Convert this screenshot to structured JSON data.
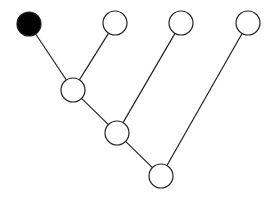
{
  "diagram": {
    "type": "binary-tree",
    "width": 267,
    "height": 198,
    "node_radius": 12,
    "colors": {
      "stroke": "#222222",
      "filled": "#000000",
      "empty": "#ffffff",
      "background": "#ffffff"
    },
    "nodes": [
      {
        "id": "leaf1",
        "x": 29,
        "y": 24,
        "filled": true
      },
      {
        "id": "leaf2",
        "x": 115,
        "y": 23,
        "filled": false
      },
      {
        "id": "leaf3",
        "x": 181,
        "y": 23,
        "filled": false
      },
      {
        "id": "leaf4",
        "x": 248,
        "y": 23,
        "filled": false
      },
      {
        "id": "internal1",
        "x": 73,
        "y": 90,
        "filled": false
      },
      {
        "id": "internal2",
        "x": 117,
        "y": 133,
        "filled": false
      },
      {
        "id": "root",
        "x": 161,
        "y": 176,
        "filled": false
      }
    ],
    "edges": [
      {
        "from": "leaf1",
        "to": "internal1"
      },
      {
        "from": "leaf2",
        "to": "internal1"
      },
      {
        "from": "internal1",
        "to": "internal2"
      },
      {
        "from": "leaf3",
        "to": "internal2"
      },
      {
        "from": "internal2",
        "to": "root"
      },
      {
        "from": "leaf4",
        "to": "root"
      }
    ]
  }
}
